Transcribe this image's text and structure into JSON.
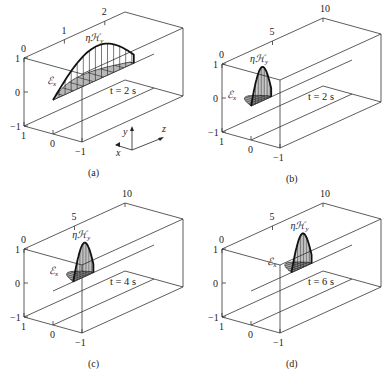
{
  "figure": {
    "panels": [
      {
        "id": "a",
        "caption": "(a)",
        "time_label": "t = 2 s",
        "z_ticks": [
          "0",
          "1",
          "2"
        ],
        "z_range": [
          0,
          2.5
        ],
        "z_tick_values": [
          0,
          1,
          2
        ],
        "y_ticks": [
          "1",
          "0",
          "−1"
        ],
        "x_ticks": [
          "1",
          "0",
          "−1"
        ],
        "h_label": "ηℋ",
        "h_label_sub": "y",
        "e_label": "ℰ",
        "e_label_sub": "x",
        "wave_start_z": 0,
        "wave_end_z": 2,
        "show_coord_axes": true,
        "coord_axes": {
          "x": "x",
          "y": "y",
          "z": "z"
        }
      },
      {
        "id": "b",
        "caption": "(b)",
        "time_label": "t = 2 s",
        "z_ticks": [
          "0",
          "5",
          "10"
        ],
        "z_range": [
          0,
          10
        ],
        "z_tick_values": [
          0,
          5,
          10
        ],
        "y_ticks": [
          "1",
          "0",
          "−1"
        ],
        "x_ticks": [
          "1",
          "0",
          "−1"
        ],
        "h_label": "ηℋ",
        "h_label_sub": "y",
        "e_label": "ℰ",
        "e_label_sub": "x",
        "wave_start_z": 0,
        "wave_end_z": 2,
        "show_coord_axes": false
      },
      {
        "id": "c",
        "caption": "(c)",
        "time_label": "t = 4 s",
        "z_ticks": [
          "0",
          "5",
          "10"
        ],
        "z_range": [
          0,
          10
        ],
        "z_tick_values": [
          0,
          5,
          10
        ],
        "y_ticks": [
          "1",
          "0",
          "−1"
        ],
        "x_ticks": [
          "1",
          "0",
          "−1"
        ],
        "h_label": "ηℋ",
        "h_label_sub": "y",
        "e_label": "ℰ",
        "e_label_sub": "x",
        "wave_start_z": 2,
        "wave_end_z": 4,
        "show_coord_axes": false
      },
      {
        "id": "d",
        "caption": "(d)",
        "time_label": "t = 6 s",
        "z_ticks": [
          "0",
          "5",
          "10"
        ],
        "z_range": [
          0,
          10
        ],
        "z_tick_values": [
          0,
          5,
          10
        ],
        "y_ticks": [
          "1",
          "0",
          "−1"
        ],
        "x_ticks": [
          "1",
          "0",
          "−1"
        ],
        "h_label": "ηℋ",
        "h_label_sub": "y",
        "e_label": "ℰ",
        "e_label_sub": "x",
        "wave_start_z": 4,
        "wave_end_z": 6,
        "show_coord_axes": false
      }
    ]
  }
}
